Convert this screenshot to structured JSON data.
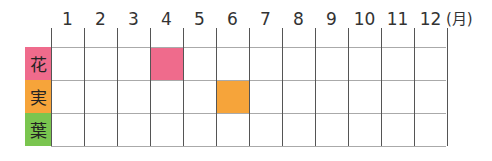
{
  "chart_data": {
    "type": "table",
    "title": "",
    "columns": [
      "1",
      "2",
      "3",
      "4",
      "5",
      "6",
      "7",
      "8",
      "9",
      "10",
      "11",
      "12"
    ],
    "unit": "(月)",
    "rows": [
      {
        "label": "花",
        "color": "#ef6b8c",
        "months": [
          4
        ]
      },
      {
        "label": "実",
        "color": "#f6a43a",
        "months": [
          6
        ]
      },
      {
        "label": "葉",
        "color": "#7ac54f",
        "months": []
      }
    ]
  },
  "header": {
    "months": [
      "1",
      "2",
      "3",
      "4",
      "5",
      "6",
      "7",
      "8",
      "9",
      "10",
      "11",
      "12"
    ],
    "unit": "(月)"
  },
  "rows": [
    {
      "label": "花",
      "color": "#ef6b8c"
    },
    {
      "label": "実",
      "color": "#f6a43a"
    },
    {
      "label": "葉",
      "color": "#7ac54f"
    }
  ],
  "highlights": [
    {
      "row": 0,
      "month": 4,
      "color": "#ef6b8c"
    },
    {
      "row": 1,
      "month": 6,
      "color": "#f6a43a"
    }
  ]
}
